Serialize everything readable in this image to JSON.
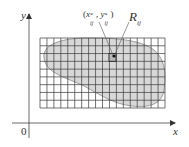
{
  "diagram": {
    "axes": {
      "x_label": "x",
      "y_label": "y",
      "origin_label": "0"
    },
    "point_label": "(x*ij, y*ij)",
    "point_label_parts": {
      "open": "(",
      "x": "x",
      "x_sup": "*",
      "x_sub": "ij",
      "sep": ", ",
      "y": "y",
      "y_sup": "*",
      "y_sub": "ij",
      "close": ")"
    },
    "rect_label": {
      "main": "R",
      "sub": "ij"
    },
    "grid": {
      "columns": 18,
      "rows": 9
    },
    "colors": {
      "region_fill": "#d6d6d6",
      "grid_line": "#3a3a3a",
      "axis": "#444444",
      "highlight_cell": "#bcbcbc"
    }
  }
}
